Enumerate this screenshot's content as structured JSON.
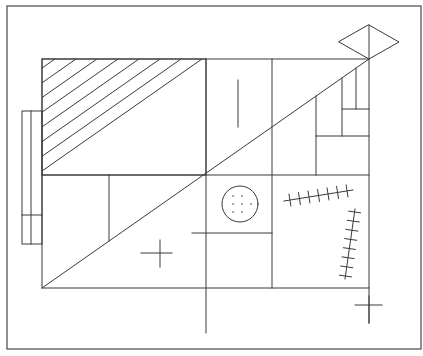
{
  "diagram": {
    "title": "",
    "line_color": "#3a3a3a",
    "frame_color": "#555555",
    "background": "#ffffff",
    "elements": [
      {
        "id": "outer-frame",
        "kind": "rectangle"
      },
      {
        "id": "main-rectangle",
        "kind": "rectangle"
      },
      {
        "id": "hatched-panel",
        "kind": "hatched-rectangle",
        "hatch_count": 15
      },
      {
        "id": "main-diagonal",
        "kind": "line"
      },
      {
        "id": "diamond",
        "kind": "polygon"
      },
      {
        "id": "side-box",
        "kind": "rectangle",
        "divided": true
      },
      {
        "id": "dotted-circle",
        "kind": "circle",
        "dot_count": 7
      },
      {
        "id": "cross-left",
        "kind": "cross"
      },
      {
        "id": "cross-bottom-right",
        "kind": "cross"
      },
      {
        "id": "stitched-line-horizontal",
        "kind": "stitched-line",
        "tick_count": 7
      },
      {
        "id": "stitched-line-vertical",
        "kind": "stitched-line",
        "tick_count": 8
      },
      {
        "id": "short-vertical-mark",
        "kind": "line"
      }
    ]
  }
}
